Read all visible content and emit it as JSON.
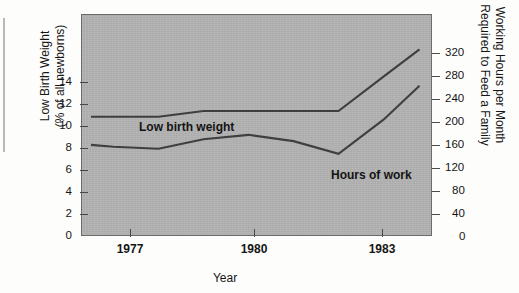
{
  "chart_data": {
    "type": "line",
    "title": "",
    "xlabel": "Year",
    "grid": false,
    "legend_position": "inline-annotations",
    "x": [
      1976.5,
      1977,
      1978,
      1979,
      1980,
      1981,
      1982,
      1983,
      1983.8
    ],
    "xlim": [
      1976.3,
      1984.1
    ],
    "xticks": [
      1977,
      1980,
      1983
    ],
    "xtick_labels": [
      "1977",
      "1980",
      "1983"
    ],
    "axes": [
      {
        "side": "left",
        "label": "Low Birth Weight\n(% of all newborns)",
        "lim": [
          0,
          15.5
        ],
        "ticks": [
          0,
          2,
          4,
          6,
          8,
          10,
          12,
          14
        ],
        "tick_labels": [
          "0",
          "2",
          "4",
          "6",
          "8",
          "10",
          "12",
          "14"
        ]
      },
      {
        "side": "right",
        "label": "Working Hours per Month\nRequired to Feed a Family",
        "lim": [
          0,
          352
        ],
        "ticks": [
          0,
          40,
          80,
          120,
          160,
          200,
          240,
          280,
          320
        ],
        "tick_labels": [
          "0",
          "40",
          "80",
          "120",
          "160",
          "200",
          "240",
          "280",
          "320"
        ]
      }
    ],
    "series": [
      {
        "name": "Low birth weight",
        "axis": "left",
        "unit": "% of all newborns",
        "annotation": "Low birth weight",
        "color": "#403f3f",
        "values": [
          8.4,
          8.4,
          8.4,
          8.8,
          8.8,
          8.8,
          8.8,
          11.2,
          13.1
        ]
      },
      {
        "name": "Hours of work",
        "axis": "right",
        "unit": "working hours per month",
        "annotation": "Hours of work",
        "color": "#403f3f",
        "values": [
          146,
          143,
          140,
          155,
          162,
          152,
          132,
          186,
          240
        ]
      }
    ],
    "plot_background_color": "#b2b2b2"
  }
}
